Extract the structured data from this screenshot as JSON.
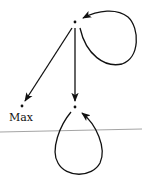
{
  "diagram": {
    "type": "directed-graph",
    "nodes": [
      {
        "id": "top",
        "label": "",
        "x": 75,
        "y": 22
      },
      {
        "id": "max",
        "label": "Max",
        "x": 22,
        "y": 106
      },
      {
        "id": "bottom",
        "label": "",
        "x": 75,
        "y": 107
      }
    ],
    "edges": [
      {
        "from": "top",
        "to": "max"
      },
      {
        "from": "top",
        "to": "bottom"
      },
      {
        "from": "top",
        "to": "top",
        "kind": "self-loop"
      },
      {
        "from": "bottom",
        "to": "bottom",
        "kind": "self-loop"
      }
    ],
    "divider": {
      "y_left": 132,
      "y_right": 129,
      "color": "#9a9a9a"
    },
    "colors": {
      "stroke": "#111111",
      "background": "#ffffff"
    }
  },
  "labels": {
    "max": "Max"
  }
}
